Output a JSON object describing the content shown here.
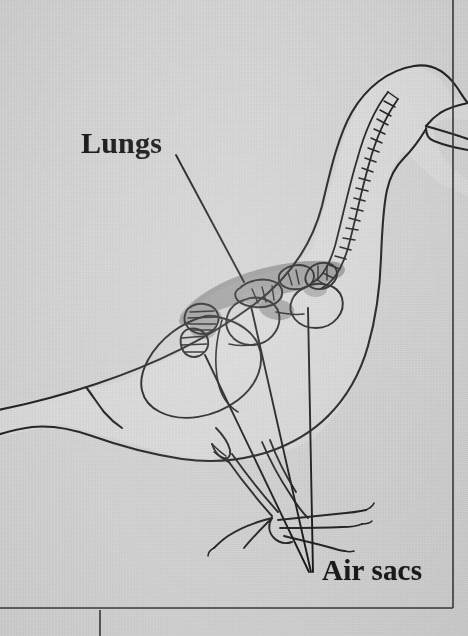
{
  "figure": {
    "kind": "anatomical-diagram",
    "medium": "scanned textbook page",
    "background_color": "#d6d6d6",
    "ink_color": "#1f1f1f",
    "body_fill_color": "#dcdcdc",
    "lung_shade_color": "#9a9a9a",
    "airsac_shade_color": "#a8a8a8"
  },
  "labels": {
    "lungs": "Lungs",
    "air_sacs": "Air sacs"
  },
  "leaders": {
    "lungs_note": "single line from label to shaded lung band",
    "air_sacs_note": "three lines converging from label to air sacs"
  },
  "page_borders": {
    "right_rule": true,
    "bottom_rule": true,
    "column_tick": true
  },
  "anatomy_parts": [
    {
      "name": "body-outline",
      "interactable": false
    },
    {
      "name": "tail",
      "interactable": false
    },
    {
      "name": "head",
      "interactable": false
    },
    {
      "name": "beak",
      "interactable": false
    },
    {
      "name": "trachea",
      "interactable": false
    },
    {
      "name": "lung",
      "interactable": false
    },
    {
      "name": "anterior-air-sacs",
      "interactable": false
    },
    {
      "name": "posterior-air-sacs",
      "interactable": false
    },
    {
      "name": "abdominal-air-sac",
      "interactable": false
    },
    {
      "name": "legs",
      "interactable": false
    },
    {
      "name": "feet",
      "interactable": false
    }
  ]
}
